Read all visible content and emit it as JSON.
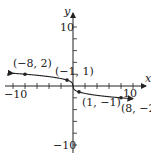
{
  "chart_data": {
    "type": "line",
    "title": "",
    "xlabel": "x",
    "ylabel": "y",
    "xlim": [
      -10,
      10
    ],
    "ylim": [
      -10,
      10
    ],
    "grid": false,
    "tick_step": 2,
    "tick_labels": {
      "x_neg": "−10",
      "x_pos": "10",
      "y_pos": "10",
      "y_neg": "−10"
    },
    "series": [
      {
        "name": "y = -cbrt(x)",
        "points": [
          {
            "x": -8,
            "y": 2,
            "label": "(−8, 2)"
          },
          {
            "x": -1,
            "y": 1,
            "label": "(−1, 1)"
          },
          {
            "x": 1,
            "y": -1,
            "label": "(1, −1)"
          },
          {
            "x": 8,
            "y": -2,
            "label": "(8, −2)"
          }
        ]
      }
    ]
  }
}
